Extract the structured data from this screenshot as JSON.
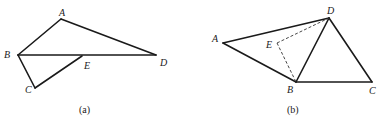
{
  "figures": [
    {
      "id": "a",
      "caption": "(a)",
      "vertices": {
        "A": {
          "label": "A",
          "x": 61,
          "y": 19
        },
        "B": {
          "label": "B",
          "x": 18,
          "y": 55
        },
        "C": {
          "label": "C",
          "x": 35,
          "y": 88
        },
        "D": {
          "label": "D",
          "x": 156,
          "y": 55
        },
        "E": {
          "label": "E",
          "x": 82,
          "y": 56
        }
      },
      "edges_solid": [
        [
          "A",
          "B"
        ],
        [
          "A",
          "D"
        ],
        [
          "B",
          "D"
        ],
        [
          "B",
          "C"
        ],
        [
          "C",
          "E"
        ]
      ],
      "edges_dashed": []
    },
    {
      "id": "b",
      "caption": "(b)",
      "vertices": {
        "A": {
          "label": "A",
          "x": 223,
          "y": 43
        },
        "B": {
          "label": "B",
          "x": 296,
          "y": 82
        },
        "C": {
          "label": "C",
          "x": 372,
          "y": 82
        },
        "D": {
          "label": "D",
          "x": 329,
          "y": 18
        },
        "E": {
          "label": "E",
          "x": 277,
          "y": 43
        }
      },
      "edges_solid": [
        [
          "A",
          "D"
        ],
        [
          "A",
          "B"
        ],
        [
          "B",
          "D"
        ],
        [
          "B",
          "C"
        ],
        [
          "C",
          "D"
        ]
      ],
      "edges_dashed": [
        [
          "E",
          "D"
        ],
        [
          "E",
          "B"
        ]
      ]
    }
  ]
}
